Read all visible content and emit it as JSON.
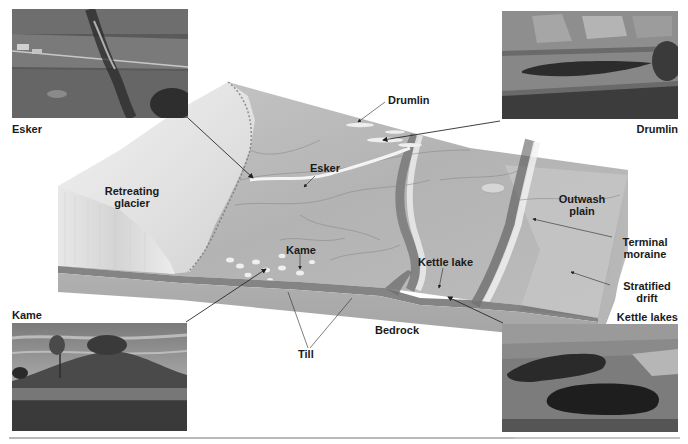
{
  "figure": {
    "block_labels": {
      "retreating_glacier": [
        "Retreating",
        "glacier"
      ],
      "esker": "Esker",
      "drumlin": "Drumlin",
      "kame": "Kame",
      "kettle_lake": "Kettle lake",
      "outwash_plain": [
        "Outwash",
        "plain"
      ],
      "terminal_moraine": [
        "Terminal",
        "moraine"
      ],
      "stratified_drift": [
        "Stratified",
        "drift"
      ],
      "bedrock": "Bedrock",
      "till": "Till"
    },
    "photos": [
      {
        "id": "esker",
        "caption": "Esker",
        "position": "top-left"
      },
      {
        "id": "drumlin",
        "caption": "Drumlin",
        "position": "top-right"
      },
      {
        "id": "kame",
        "caption": "Kame",
        "position": "bottom-left"
      },
      {
        "id": "kettle_lakes",
        "caption": "Kettle lakes",
        "position": "bottom-right"
      }
    ],
    "colors": {
      "label_text": "#1a1a1a",
      "leader_line": "#2a2a2a",
      "terrain": "#b8b8b8",
      "bedrock": "#a9a9a9",
      "glacier": "#e6e6e6",
      "rule": "#b9b9b9"
    }
  }
}
